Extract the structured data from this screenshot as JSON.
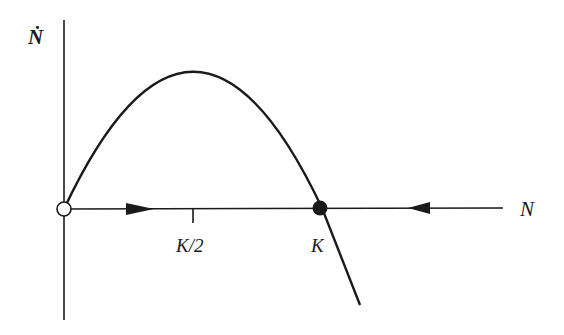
{
  "diagram": {
    "type": "phase-portrait",
    "y_axis_label": "Ṅ",
    "x_axis_label": "N",
    "tick_labels": [
      "K/2",
      "K"
    ],
    "fixed_points": [
      {
        "label": "0",
        "type": "unstable",
        "marker": "open-circle"
      },
      {
        "label": "K",
        "type": "stable",
        "marker": "filled-circle"
      }
    ],
    "flow_arrows": [
      {
        "region": "0 < N < K",
        "direction": "right"
      },
      {
        "region": "N > K",
        "direction": "left"
      }
    ],
    "curve": "parabola Ṅ = rN(1 − N/K), maximum at K/2",
    "colors": {
      "ink": "#1a1a1a",
      "background": "#ffffff"
    }
  }
}
